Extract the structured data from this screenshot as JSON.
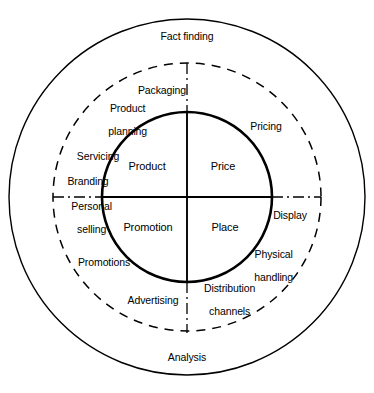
{
  "diagram": {
    "type": "concentric-circle-diagram",
    "colors": {
      "stroke": "#000000",
      "background": "#ffffff",
      "text": "#000000"
    },
    "rings": [
      {
        "name": "outer-ring",
        "style": "solid-thin",
        "labels": [
          {
            "key": "fact_finding",
            "text": "Fact finding"
          },
          {
            "key": "analysis",
            "text": "Analysis"
          }
        ]
      },
      {
        "name": "middle-ring",
        "style": "dashed",
        "labels": [
          {
            "key": "packaging",
            "text": "Packaging"
          },
          {
            "key": "product_planning",
            "text": "Product\nplanning"
          },
          {
            "key": "servicing",
            "text": "Servicing"
          },
          {
            "key": "branding",
            "text": "Branding"
          },
          {
            "key": "personal_selling",
            "text": "Personal\nselling"
          },
          {
            "key": "promotions",
            "text": "Promotions"
          },
          {
            "key": "advertising",
            "text": "Advertising"
          },
          {
            "key": "distribution_channels",
            "text": "Distribution\nchannels"
          },
          {
            "key": "physical_handling",
            "text": "Physical\nhandling"
          },
          {
            "key": "display",
            "text": "Display"
          },
          {
            "key": "pricing",
            "text": "Pricing"
          }
        ]
      },
      {
        "name": "inner-circle",
        "style": "solid-thick",
        "labels": [
          {
            "key": "product",
            "text": "Product"
          },
          {
            "key": "price",
            "text": "Price"
          },
          {
            "key": "promotion",
            "text": "Promotion"
          },
          {
            "key": "place",
            "text": "Place"
          }
        ]
      }
    ]
  },
  "outer": {
    "fact_finding": "Fact finding",
    "analysis": "Analysis"
  },
  "middle": {
    "packaging": "Packaging",
    "product_planning_l1": "Product",
    "product_planning_l2": "planning",
    "servicing": "Servicing",
    "branding": "Branding",
    "personal_selling_l1": "Personal",
    "personal_selling_l2": "selling",
    "promotions": "Promotions",
    "advertising": "Advertising",
    "distribution_channels_l1": "Distribution",
    "distribution_channels_l2": "channels",
    "physical_handling_l1": "Physical",
    "physical_handling_l2": "handling",
    "display": "Display",
    "pricing": "Pricing"
  },
  "core": {
    "product": "Product",
    "price": "Price",
    "promotion": "Promotion",
    "place": "Place"
  }
}
